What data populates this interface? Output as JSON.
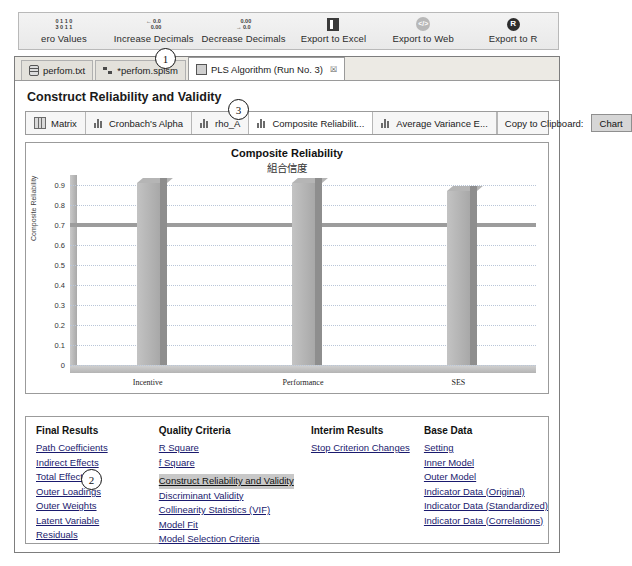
{
  "ribbon": {
    "items": [
      {
        "label": "ero Values",
        "icon": "zero-values-icon",
        "glyph": "0 1 1 0\n3 0 1 1"
      },
      {
        "label": "Increase Decimals",
        "icon": "increase-decimals-icon",
        "glyph": "← 0.0\n   0.00"
      },
      {
        "label": "Decrease Decimals",
        "icon": "decrease-decimals-icon",
        "glyph": "   0.00\n→ 0.0"
      },
      {
        "label": "Export to Excel",
        "icon": "export-to-excel-icon",
        "glyph": ""
      },
      {
        "label": "Export to Web",
        "icon": "export-to-web-icon",
        "glyph": "</>"
      },
      {
        "label": "Export to R",
        "icon": "export-to-r-icon",
        "glyph": "R"
      }
    ]
  },
  "tabs": [
    {
      "label": "perfom.txt",
      "icon": "database-icon",
      "active": false,
      "closable": false
    },
    {
      "label": "*perfom.splsm",
      "icon": "network-icon",
      "active": false,
      "closable": false
    },
    {
      "label": "PLS Algorithm (Run No. 3)",
      "icon": "grid-icon",
      "active": true,
      "closable": true,
      "close": "☒"
    }
  ],
  "page_title": "Construct Reliability and Validity",
  "result_toolbar": {
    "buttons": [
      {
        "label": "Matrix",
        "icon": "matrix-icon",
        "selected": false
      },
      {
        "label": "Cronbach's Alpha",
        "icon": "bar-chart-icon",
        "selected": false
      },
      {
        "label": "rho_A",
        "icon": "bar-chart-icon",
        "selected": false
      },
      {
        "label": "Composite Reliabilit...",
        "icon": "bar-chart-icon",
        "selected": true
      },
      {
        "label": "Average Variance E...",
        "icon": "bar-chart-icon",
        "selected": false
      }
    ],
    "copy_label": "Copy to Clipboard:",
    "chart_button": "Chart"
  },
  "chart_data": {
    "type": "bar",
    "title": "Composite Reliability",
    "subtitle": "組合信度",
    "categories": [
      "Incentive",
      "Performance",
      "SES"
    ],
    "values": [
      0.91,
      0.91,
      0.87
    ],
    "xlabel": "",
    "ylabel": "Composite Reliability",
    "ylim": [
      0,
      0.95
    ],
    "yticks": [
      0,
      0.1,
      0.2,
      0.3,
      0.4,
      0.5,
      0.6,
      0.7,
      0.8,
      0.9
    ],
    "ytick_labels": [
      "0",
      "0.1",
      "0.2",
      "0.3",
      "0.4",
      "0.5",
      "0.6",
      "0.7",
      "0.8",
      "0.9"
    ],
    "reference_line": 0.7,
    "grid": true,
    "legend": "none",
    "bar_color": "#b0b0b0"
  },
  "link_panel": {
    "columns": [
      {
        "heading": "Final Results",
        "links": [
          {
            "label": "Path Coefficients",
            "highlighted": false
          },
          {
            "label": "Indirect Effects",
            "highlighted": false
          },
          {
            "label": "Total Effects",
            "highlighted": false
          },
          {
            "label": "Outer Loadings",
            "highlighted": false
          },
          {
            "label": "Outer Weights",
            "highlighted": false
          },
          {
            "label": "Latent Variable",
            "highlighted": false
          },
          {
            "label": "Residuals",
            "highlighted": false
          }
        ]
      },
      {
        "heading": "Quality Criteria",
        "links": [
          {
            "label": "R Square",
            "highlighted": false
          },
          {
            "label": "f Square",
            "highlighted": false
          },
          {
            "label": "Construct Reliability and Validity",
            "highlighted": true
          },
          {
            "label": "Discriminant Validity",
            "highlighted": false
          },
          {
            "label": "Collinearity Statistics (VIF)",
            "highlighted": false
          },
          {
            "label": "Model Fit",
            "highlighted": false
          },
          {
            "label": "Model Selection Criteria",
            "highlighted": false
          }
        ]
      },
      {
        "heading": "Interim Results",
        "links": [
          {
            "label": "Stop Criterion Changes",
            "highlighted": false
          }
        ]
      },
      {
        "heading": "Base Data",
        "links": [
          {
            "label": "Setting",
            "highlighted": false
          },
          {
            "label": "Inner Model",
            "highlighted": false
          },
          {
            "label": "Outer Model",
            "highlighted": false
          },
          {
            "label": "Indicator Data (Original)",
            "highlighted": false
          },
          {
            "label": "Indicator Data (Standardized)",
            "highlighted": false
          },
          {
            "label": "Indicator Data (Correlations)",
            "highlighted": false
          }
        ]
      }
    ]
  },
  "annotations": [
    {
      "label": "1",
      "x": 155,
      "y": 48
    },
    {
      "label": "2",
      "x": 81,
      "y": 469
    },
    {
      "label": "3",
      "x": 228,
      "y": 99
    }
  ]
}
